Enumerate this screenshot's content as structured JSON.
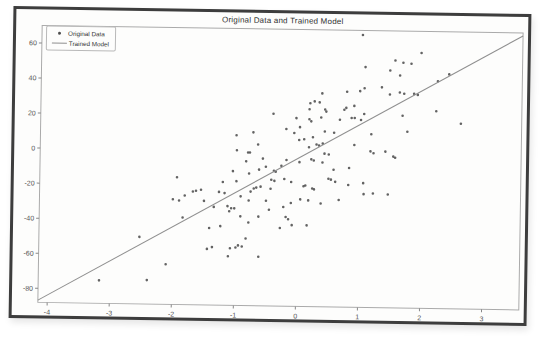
{
  "colors": {
    "frame": "#3d3d3d",
    "paper": "#fdfdfc",
    "spine": "#aaaaaa",
    "tick": "#888888",
    "tick_text": "#555555",
    "point": "#4d4d4d",
    "model_line": "#8f8f8f",
    "title_text": "#2f2f2f"
  },
  "chart_data": {
    "type": "scatter",
    "title": "Original Data and Trained Model",
    "xlabel": "",
    "ylabel": "",
    "xlim": [
      -4.15,
      3.6
    ],
    "ylim": [
      -88,
      70
    ],
    "xticks": [
      -4,
      -3,
      -2,
      -1,
      0,
      1,
      2,
      3
    ],
    "yticks": [
      -80,
      -60,
      -40,
      -20,
      0,
      20,
      40,
      60
    ],
    "grid": false,
    "legend_position": "upper left",
    "series": [
      {
        "name": "Original Data",
        "type": "scatter",
        "marker": "point",
        "points": [
          [
            -0.99,
            9.1
          ],
          [
            -0.72,
            10.9
          ],
          [
            -0.64,
            4.0
          ],
          [
            -0.98,
            0.6
          ],
          [
            -0.8,
            -0.6
          ],
          [
            -0.77,
            -0.6
          ],
          [
            -0.56,
            -4.0
          ],
          [
            -0.83,
            -5.7
          ],
          [
            -0.51,
            -8.6
          ],
          [
            -0.62,
            -10.3
          ],
          [
            -1.04,
            -11.4
          ],
          [
            -0.78,
            -12.6
          ],
          [
            -1.94,
            -15.4
          ],
          [
            -1.2,
            -17.7
          ],
          [
            -0.98,
            -17.1
          ],
          [
            -0.7,
            -21.1
          ],
          [
            -0.66,
            -20.6
          ],
          [
            -0.75,
            -22.9
          ],
          [
            -0.59,
            -20.0
          ],
          [
            -0.43,
            -21.1
          ],
          [
            -1.68,
            -23.4
          ],
          [
            -1.63,
            -22.9
          ],
          [
            -1.55,
            -22.3
          ],
          [
            -1.81,
            -25.7
          ],
          [
            -2.0,
            -28.0
          ],
          [
            -1.9,
            -28.6
          ],
          [
            -1.5,
            -28.6
          ],
          [
            -1.26,
            -23.4
          ],
          [
            -1.17,
            -24.0
          ],
          [
            -0.91,
            -25.7
          ],
          [
            -0.78,
            -28.0
          ],
          [
            -0.5,
            -28.0
          ],
          [
            -1.12,
            -31.4
          ],
          [
            -1.06,
            -32.6
          ],
          [
            -1.01,
            -32.6
          ],
          [
            -1.34,
            -32.0
          ],
          [
            -1.09,
            -34.3
          ],
          [
            -0.91,
            -37.1
          ],
          [
            -1.84,
            -38.3
          ],
          [
            -1.41,
            -44.0
          ],
          [
            -1.23,
            -42.9
          ],
          [
            -0.78,
            -40.6
          ],
          [
            -0.62,
            -37.1
          ],
          [
            -0.45,
            -33.1
          ],
          [
            -0.06,
            10.9
          ],
          [
            0.43,
            12.0
          ],
          [
            0.58,
            11.4
          ],
          [
            0.24,
            8.6
          ],
          [
            0.02,
            6.9
          ],
          [
            0.1,
            7.4
          ],
          [
            0.3,
            4.6
          ],
          [
            0.34,
            4.0
          ],
          [
            0.4,
            5.1
          ],
          [
            0.18,
            2.9
          ],
          [
            0.91,
            4.6
          ],
          [
            1.18,
            10.9
          ],
          [
            1.41,
            1.1
          ],
          [
            1.54,
            -1.7
          ],
          [
            1.57,
            -2.3
          ],
          [
            1.17,
            1.1
          ],
          [
            1.22,
            0.0
          ],
          [
            0.43,
            -0.6
          ],
          [
            0.5,
            -1.1
          ],
          [
            0.22,
            -4.0
          ],
          [
            0.26,
            -4.6
          ],
          [
            0.03,
            -5.7
          ],
          [
            -0.18,
            -4.6
          ],
          [
            -0.26,
            -8.0
          ],
          [
            -0.35,
            -11.4
          ],
          [
            -0.38,
            -10.9
          ],
          [
            -0.42,
            -16.0
          ],
          [
            -0.37,
            -16.6
          ],
          [
            -0.21,
            -15.4
          ],
          [
            -0.1,
            -17.1
          ],
          [
            0.1,
            -19.4
          ],
          [
            0.13,
            -18.9
          ],
          [
            0.4,
            -5.7
          ],
          [
            0.58,
            -9.7
          ],
          [
            0.83,
            -8.6
          ],
          [
            0.5,
            -14.9
          ],
          [
            0.54,
            -15.4
          ],
          [
            0.61,
            -16.6
          ],
          [
            0.82,
            -18.3
          ],
          [
            1.06,
            -17.1
          ],
          [
            0.27,
            -21.1
          ],
          [
            0.24,
            -20.6
          ],
          [
            0.05,
            -26.9
          ],
          [
            0.18,
            -27.4
          ],
          [
            -0.1,
            -29.1
          ],
          [
            -0.22,
            -31.4
          ],
          [
            0.38,
            -29.1
          ],
          [
            0.67,
            -26.9
          ],
          [
            1.07,
            -23.4
          ],
          [
            1.22,
            -22.9
          ],
          [
            1.46,
            -23.4
          ],
          [
            -0.18,
            -37.1
          ],
          [
            -0.14,
            -38.3
          ],
          [
            -0.27,
            -43.4
          ],
          [
            -0.08,
            -41.7
          ],
          [
            0.16,
            -41.7
          ],
          [
            1.02,
            67.4
          ],
          [
            1.55,
            53.1
          ],
          [
            1.68,
            52.0
          ],
          [
            1.81,
            51.4
          ],
          [
            1.47,
            47.4
          ],
          [
            1.63,
            44.6
          ],
          [
            1.07,
            49.1
          ],
          [
            1.34,
            37.7
          ],
          [
            1.63,
            34.9
          ],
          [
            1.7,
            34.3
          ],
          [
            1.47,
            33.7
          ],
          [
            0.99,
            35.4
          ],
          [
            1.06,
            37.1
          ],
          [
            0.78,
            34.9
          ],
          [
            0.9,
            26.9
          ],
          [
            0.74,
            24.6
          ],
          [
            0.77,
            25.7
          ],
          [
            1.06,
            22.3
          ],
          [
            1.01,
            18.9
          ],
          [
            0.86,
            20.0
          ],
          [
            0.91,
            20.0
          ],
          [
            0.67,
            18.9
          ],
          [
            0.38,
            33.7
          ],
          [
            0.34,
            28.6
          ],
          [
            0.19,
            28.0
          ],
          [
            0.26,
            29.1
          ],
          [
            0.18,
            24.6
          ],
          [
            0.37,
            20.0
          ],
          [
            0.43,
            24.6
          ],
          [
            0.45,
            23.4
          ],
          [
            -0.03,
            19.4
          ],
          [
            0.18,
            18.9
          ],
          [
            0.21,
            17.7
          ],
          [
            0.03,
            14.3
          ],
          [
            -0.19,
            13.1
          ],
          [
            1.68,
            21.7
          ],
          [
            1.97,
            57.7
          ],
          [
            2.42,
            45.7
          ],
          [
            2.24,
            41.7
          ],
          [
            1.86,
            34.3
          ],
          [
            1.92,
            33.7
          ],
          [
            2.22,
            24.6
          ],
          [
            2.62,
            17.7
          ],
          [
            1.76,
            12.6
          ],
          [
            -0.4,
            21.7
          ],
          [
            -0.82,
            -49.7
          ],
          [
            -1.44,
            -56.0
          ],
          [
            -1.36,
            -54.9
          ],
          [
            -1.07,
            -55.4
          ],
          [
            -0.98,
            -54.9
          ],
          [
            -0.94,
            -53.7
          ],
          [
            -0.88,
            -54.3
          ],
          [
            -1.1,
            -60.0
          ],
          [
            -0.61,
            -60.0
          ],
          [
            -2.1,
            -65.1
          ],
          [
            -2.4,
            -74.3
          ],
          [
            -2.53,
            -49.7
          ],
          [
            -3.17,
            -74.9
          ]
        ]
      },
      {
        "name": "Trained Model",
        "type": "line",
        "x": [
          -4.15,
          3.6
        ],
        "y": [
          -86.7,
          68.3
        ]
      }
    ]
  }
}
